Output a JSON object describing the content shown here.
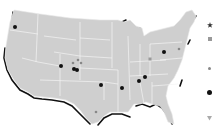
{
  "map": {
    "region": "United States (contiguous)",
    "land_color": "#cfcfcf",
    "border_color": "#f2f2f2",
    "coast_shadow_color": "#111111",
    "background_color": "#ffffff"
  },
  "markers": [
    {
      "type": "large-circle",
      "x": 15,
      "y": 27,
      "area": "Washington"
    },
    {
      "type": "large-circle",
      "x": 61,
      "y": 66,
      "area": "Utah"
    },
    {
      "type": "small-circle",
      "x": 73,
      "y": 63,
      "area": "Colorado"
    },
    {
      "type": "small-circle",
      "x": 78,
      "y": 60,
      "area": "Colorado"
    },
    {
      "type": "small-circle",
      "x": 81,
      "y": 63,
      "area": "Colorado"
    },
    {
      "type": "large-circle",
      "x": 74,
      "y": 69,
      "area": "Colorado"
    },
    {
      "type": "large-circle",
      "x": 77,
      "y": 70,
      "area": "Colorado"
    },
    {
      "type": "large-circle",
      "x": 101,
      "y": 85,
      "area": "Oklahoma"
    },
    {
      "type": "large-circle",
      "x": 122,
      "y": 88,
      "area": "Arkansas"
    },
    {
      "type": "large-circle",
      "x": 139,
      "y": 81,
      "area": "Tennessee"
    },
    {
      "type": "large-circle",
      "x": 145,
      "y": 77,
      "area": "Tennessee"
    },
    {
      "type": "large-circle",
      "x": 164,
      "y": 52,
      "area": "Pennsylvania"
    },
    {
      "type": "square",
      "x": 150,
      "y": 59,
      "area": "Indiana"
    },
    {
      "type": "small-circle",
      "x": 179,
      "y": 49,
      "area": "New Jersey"
    },
    {
      "type": "small-circle",
      "x": 96,
      "y": 112,
      "area": "Texas"
    }
  ],
  "legend": {
    "items": [
      {
        "symbol": "star-icon",
        "y": 7,
        "color": "#333333"
      },
      {
        "symbol": "square-icon",
        "y": 21,
        "color": "#999999"
      },
      {
        "symbol": "small-circle-icon",
        "y": 50,
        "color": "#888888"
      },
      {
        "symbol": "large-circle-icon",
        "y": 74,
        "color": "#111111"
      },
      {
        "symbol": "triangle-down-icon",
        "y": 100,
        "color": "#aaaaaa"
      }
    ]
  }
}
